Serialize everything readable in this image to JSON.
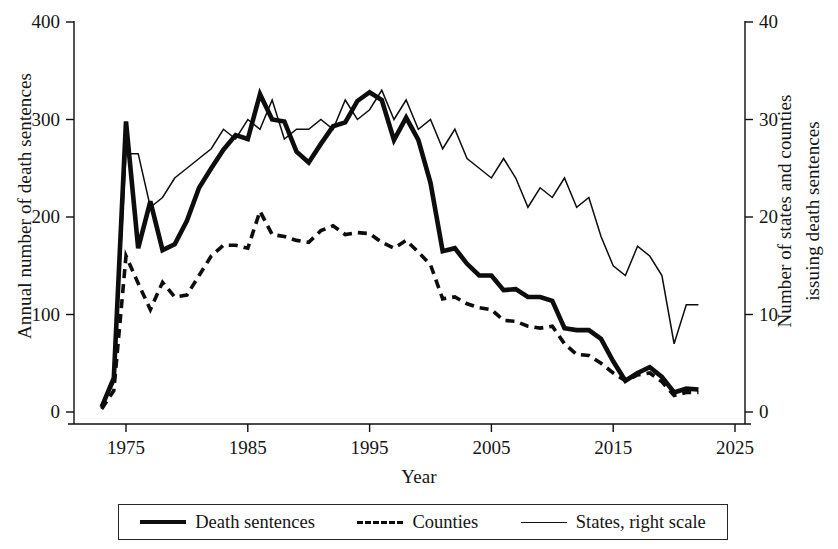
{
  "chart_data": {
    "type": "line",
    "title": "",
    "xlabel": "Year",
    "ylabel": "Annual number of death sentences",
    "ylabel_right_line1": "Number of states and counties",
    "ylabel_right_line2": "issuing death sentences",
    "grid": false,
    "legend_position": "bottom",
    "xlim": [
      1972,
      2025
    ],
    "xticks": [
      1975,
      1985,
      1995,
      2005,
      2015,
      2025
    ],
    "xticklabels": [
      "1975",
      "1985",
      "1995",
      "2005",
      "2015",
      "2025"
    ],
    "ylim": [
      0,
      400
    ],
    "yticks": [
      0,
      100,
      200,
      300,
      400
    ],
    "yticklabels": [
      "0",
      "100",
      "200",
      "300",
      "400"
    ],
    "ylim_right": [
      0,
      40
    ],
    "yticks_right": [
      0,
      10,
      20,
      30,
      40
    ],
    "yticklabels_right": [
      "0",
      "10",
      "20",
      "30",
      "40"
    ],
    "x": [
      1973,
      1974,
      1975,
      1976,
      1977,
      1978,
      1979,
      1980,
      1981,
      1982,
      1983,
      1984,
      1985,
      1986,
      1987,
      1988,
      1989,
      1990,
      1991,
      1992,
      1993,
      1994,
      1995,
      1996,
      1997,
      1998,
      1999,
      2000,
      2001,
      2002,
      2003,
      2004,
      2005,
      2006,
      2007,
      2008,
      2009,
      2010,
      2011,
      2012,
      2013,
      2014,
      2015,
      2016,
      2017,
      2018,
      2019,
      2020,
      2021,
      2022
    ],
    "series": [
      {
        "name": "Death sentences",
        "axis": "left",
        "style": "thick-solid",
        "values": [
          5,
          35,
          298,
          168,
          216,
          166,
          172,
          196,
          230,
          250,
          269,
          284,
          280,
          326,
          300,
          298,
          267,
          256,
          275,
          293,
          297,
          319,
          328,
          320,
          279,
          302,
          279,
          235,
          165,
          168,
          152,
          140,
          140,
          125,
          126,
          118,
          118,
          114,
          86,
          84,
          84,
          75,
          52,
          32,
          40,
          46,
          36,
          20,
          24,
          23
        ]
      },
      {
        "name": "Counties",
        "axis": "left",
        "style": "dashed",
        "values": [
          3,
          22,
          160,
          132,
          105,
          133,
          118,
          120,
          140,
          160,
          171,
          171,
          168,
          206,
          182,
          180,
          176,
          174,
          186,
          191,
          182,
          184,
          183,
          174,
          168,
          176,
          164,
          151,
          116,
          118,
          111,
          107,
          105,
          94,
          93,
          88,
          86,
          88,
          70,
          59,
          58,
          50,
          40,
          32,
          38,
          40,
          31,
          17,
          20,
          20
        ]
      },
      {
        "name": "States, right scale",
        "axis": "right",
        "style": "thin-solid",
        "values": [
          0.5,
          3,
          26.5,
          26.5,
          21,
          22,
          24,
          25,
          26,
          27,
          29,
          28,
          30,
          29,
          32,
          28,
          29,
          29,
          30,
          29,
          32,
          30,
          31,
          33,
          30,
          32,
          29,
          30,
          27,
          29,
          26,
          25,
          24,
          26,
          24,
          21,
          23,
          22,
          24,
          21,
          22,
          18,
          15,
          14,
          17,
          16,
          14,
          7,
          11,
          11
        ]
      }
    ]
  },
  "axes": {
    "left_title": "Annual number of death sentences",
    "right_title_line1": "Number of states and counties",
    "right_title_line2": "issuing death sentences",
    "x_title": "Year"
  },
  "legend": {
    "items": [
      {
        "label": "Death sentences",
        "swatch": "thick-solid-line-icon"
      },
      {
        "label": "Counties",
        "swatch": "dashed-line-icon"
      },
      {
        "label": "States, right scale",
        "swatch": "thin-solid-line-icon"
      }
    ]
  },
  "colors": {
    "ink": "#0d0d0d",
    "background": "#ffffff"
  }
}
